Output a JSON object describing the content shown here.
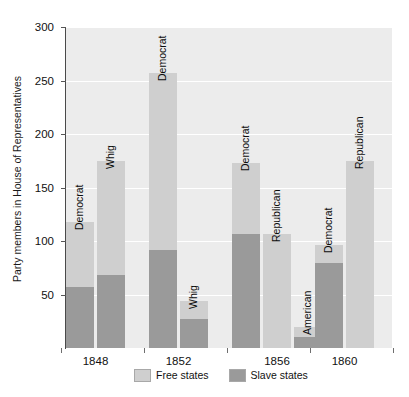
{
  "chart_data": {
    "type": "bar",
    "title": "",
    "xlabel": "",
    "ylabel": "Party members in House of Representatives",
    "ylim": [
      0,
      300
    ],
    "yticks": [
      50,
      100,
      150,
      200,
      250,
      300
    ],
    "grid": true,
    "stacked": true,
    "legend_position": "bottom",
    "categories": [
      "1848",
      "1852",
      "1856",
      "1860"
    ],
    "series": [
      {
        "name": "Free states",
        "color": "#cfcfcf"
      },
      {
        "name": "Slave states",
        "color": "#9a9a9a"
      }
    ],
    "groups": [
      {
        "category": "1848",
        "bars": [
          {
            "label": "Democrat",
            "free": 61,
            "slave": 57,
            "total": 118
          },
          {
            "label": "Whig",
            "free": 107,
            "slave": 68,
            "total": 175
          }
        ]
      },
      {
        "category": "1852",
        "bars": [
          {
            "label": "Democrat",
            "free": 165,
            "slave": 92,
            "total": 257
          },
          {
            "label": "Whig",
            "free": 17,
            "slave": 27,
            "total": 44
          }
        ]
      },
      {
        "category": "1856",
        "bars": [
          {
            "label": "Democrat",
            "free": 66,
            "slave": 107,
            "total": 173
          },
          {
            "label": "Republican",
            "free": 107,
            "slave": 0,
            "total": 107
          },
          {
            "label": "American",
            "free": 10,
            "slave": 10,
            "total": 20
          }
        ]
      },
      {
        "category": "1860",
        "bars": [
          {
            "label": "Democrat",
            "free": 17,
            "slave": 79,
            "total": 96
          },
          {
            "label": "Republican",
            "free": 175,
            "slave": 0,
            "total": 175
          }
        ]
      }
    ]
  },
  "axis": {
    "ytick_labels": [
      "50",
      "100",
      "150",
      "200",
      "250",
      "300"
    ],
    "xtick_labels": [
      "1848",
      "1852",
      "1856",
      "1860"
    ]
  },
  "legend": {
    "items": [
      {
        "label": "Free states",
        "color": "#cfcfcf"
      },
      {
        "label": "Slave states",
        "color": "#9a9a9a"
      }
    ]
  }
}
